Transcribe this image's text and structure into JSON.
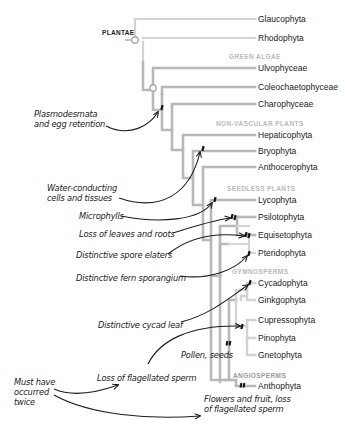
{
  "diagram": {
    "type": "phylogenetic-tree",
    "root_label": "PLANTAE",
    "clades": [
      {
        "id": "green_algae",
        "label": "GREEN ALGAE",
        "x": 229,
        "y": 57
      },
      {
        "id": "non_vascular",
        "label": "NON-VASCULAR PLANTS",
        "x": 216,
        "y": 124
      },
      {
        "id": "seedless",
        "label": "SEEDLESS PLANTS",
        "x": 227,
        "y": 189
      },
      {
        "id": "gymnosperms",
        "label": "GYMNOSPERMS",
        "x": 232,
        "y": 272
      },
      {
        "id": "angiosperms",
        "label": "ANGIOSPERMS",
        "x": 233,
        "y": 376
      }
    ],
    "taxa": [
      {
        "name": "Glaucophyta",
        "y": 19
      },
      {
        "name": "Rhodophyta",
        "y": 38
      },
      {
        "name": "Ulvophyceae",
        "y": 68
      },
      {
        "name": "Coleochaetophyceae",
        "y": 87
      },
      {
        "name": "Charophyceae",
        "y": 104
      },
      {
        "name": "Hepaticophyta",
        "y": 135
      },
      {
        "name": "Bryophyta",
        "y": 151
      },
      {
        "name": "Anthocerophyta",
        "y": 167
      },
      {
        "name": "Lycophyta",
        "y": 200
      },
      {
        "name": "Psilotophyta",
        "y": 217
      },
      {
        "name": "Equisetophyta",
        "y": 235
      },
      {
        "name": "Pteridophyta",
        "y": 253
      },
      {
        "name": "Cycadophyta",
        "y": 283
      },
      {
        "name": "Ginkgophyta",
        "y": 300
      },
      {
        "name": "Cupressophyta",
        "y": 320
      },
      {
        "name": "Pinophyta",
        "y": 338
      },
      {
        "name": "Gnetophyta",
        "y": 355
      },
      {
        "name": "Anthophyta",
        "y": 386
      }
    ],
    "annotations": [
      {
        "id": "plasmodesmata",
        "lines": [
          "Plasmodesmata",
          "and egg retention"
        ],
        "x": 34,
        "y": 109
      },
      {
        "id": "water_conducting",
        "lines": [
          "Water-conducting",
          "cells and tissues"
        ],
        "x": 47,
        "y": 183
      },
      {
        "id": "microphylls",
        "lines": [
          "Microphylls"
        ],
        "x": 79,
        "y": 212
      },
      {
        "id": "loss_leaves_roots",
        "lines": [
          "Loss of leaves and roots"
        ],
        "x": 79,
        "y": 230
      },
      {
        "id": "spore_elaters",
        "lines": [
          "Distinctive spore elaters"
        ],
        "x": 76,
        "y": 251
      },
      {
        "id": "fern_sporangium",
        "lines": [
          "Distinctive fern sporangium"
        ],
        "x": 76,
        "y": 274
      },
      {
        "id": "cycad_leaf",
        "lines": [
          "Distinctive cycad leaf"
        ],
        "x": 98,
        "y": 321
      },
      {
        "id": "pollen_seeds",
        "lines": [
          "Pollen, seeds"
        ],
        "x": 181,
        "y": 351
      },
      {
        "id": "must_have_occurred_twice",
        "lines": [
          "Must have",
          "occurred",
          "twice"
        ],
        "x": 14,
        "y": 377
      },
      {
        "id": "loss_flagellated_sperm",
        "lines": [
          "Loss of flagellated sperm"
        ],
        "x": 97,
        "y": 374
      },
      {
        "id": "flowers_fruit",
        "lines": [
          "Flowers and fruit, loss",
          "of flagellated sperm"
        ],
        "x": 204,
        "y": 395
      }
    ],
    "colors": {
      "branch_dark": "#a3a3a3",
      "branch_light": "#cfcfcf",
      "clade_label": "#b9b9b9",
      "ink": "#1b1b1b"
    }
  }
}
